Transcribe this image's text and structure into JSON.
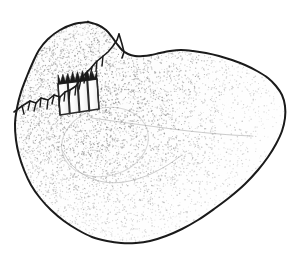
{
  "figure": {
    "domain": "scientific-line-drawing",
    "background_color": "#ffffff",
    "ink_color": "#1a1a1a",
    "stipple_color": "#8c8c8c",
    "stipple_color_dense": "#6e6e6e",
    "hatch_fill_color": "#fbfbfb",
    "hatch_line_color": "#2b2b2b",
    "width_px": 297,
    "height_px": 260,
    "labels": [],
    "scale_bar": null,
    "caption": ""
  },
  "outline": {
    "name": "specimen-outline-path",
    "stroke_width": 2,
    "description": "Rounded triangular outline, apex at right, broad lobe upper-left, rounded base lower-left to lower-centre",
    "points": [
      [
        88,
        22
      ],
      [
        74,
        24
      ],
      [
        60,
        30
      ],
      [
        48,
        39
      ],
      [
        39,
        50
      ],
      [
        33,
        62
      ],
      [
        27,
        76
      ],
      [
        21,
        92
      ],
      [
        17,
        108
      ],
      [
        15,
        124
      ],
      [
        16,
        140
      ],
      [
        19,
        155
      ],
      [
        24,
        170
      ],
      [
        31,
        185
      ],
      [
        40,
        198
      ],
      [
        51,
        210
      ],
      [
        64,
        221
      ],
      [
        78,
        230
      ],
      [
        92,
        237
      ],
      [
        107,
        241
      ],
      [
        121,
        243
      ],
      [
        136,
        243
      ],
      [
        150,
        241
      ],
      [
        166,
        236
      ],
      [
        182,
        229
      ],
      [
        198,
        220
      ],
      [
        214,
        209
      ],
      [
        230,
        197
      ],
      [
        245,
        184
      ],
      [
        258,
        170
      ],
      [
        268,
        157
      ],
      [
        276,
        144
      ],
      [
        282,
        131
      ],
      [
        285,
        118
      ],
      [
        285,
        106
      ],
      [
        282,
        95
      ],
      [
        276,
        86
      ],
      [
        268,
        78
      ],
      [
        257,
        71
      ],
      [
        245,
        65
      ],
      [
        232,
        60
      ],
      [
        219,
        56
      ],
      [
        206,
        53
      ],
      [
        193,
        51
      ],
      [
        181,
        50
      ],
      [
        170,
        51
      ],
      [
        160,
        53
      ],
      [
        151,
        55
      ],
      [
        143,
        56
      ],
      [
        135,
        56
      ],
      [
        128,
        54
      ],
      [
        122,
        50
      ],
      [
        117,
        44
      ],
      [
        112,
        37
      ],
      [
        106,
        30
      ],
      [
        98,
        25
      ],
      [
        88,
        22
      ]
    ]
  },
  "features": [
    {
      "name": "suture-crack-line",
      "type": "jagged-break-line",
      "stroke_width": 1.6,
      "description": "Irregular zig-zag fracture / suture line running from the left margin up-right to the upper notch, with short barb ticks",
      "points": [
        [
          14,
          112
        ],
        [
          22,
          106
        ],
        [
          30,
          101
        ],
        [
          36,
          103
        ],
        [
          41,
          98
        ],
        [
          48,
          100
        ],
        [
          54,
          95
        ],
        [
          60,
          97
        ],
        [
          65,
          92
        ],
        [
          70,
          90
        ],
        [
          76,
          86
        ],
        [
          80,
          80
        ],
        [
          85,
          74
        ],
        [
          91,
          68
        ],
        [
          96,
          62
        ],
        [
          102,
          57
        ],
        [
          108,
          52
        ],
        [
          113,
          46
        ],
        [
          117,
          40
        ],
        [
          119,
          34
        ]
      ],
      "barbs": [
        [
          [
            30,
            101
          ],
          [
            28,
            110
          ]
        ],
        [
          [
            36,
            103
          ],
          [
            34,
            111
          ]
        ],
        [
          [
            41,
            98
          ],
          [
            40,
            107
          ]
        ],
        [
          [
            48,
            100
          ],
          [
            47,
            109
          ]
        ],
        [
          [
            54,
            95
          ],
          [
            52,
            104
          ]
        ],
        [
          [
            60,
            97
          ],
          [
            59,
            106
          ]
        ],
        [
          [
            65,
            92
          ],
          [
            64,
            101
          ]
        ],
        [
          [
            70,
            90
          ],
          [
            69,
            99
          ]
        ],
        [
          [
            76,
            86
          ],
          [
            75,
            95
          ]
        ],
        [
          [
            81,
            79
          ],
          [
            79,
            89
          ]
        ],
        [
          [
            86,
            73
          ],
          [
            84,
            83
          ]
        ],
        [
          [
            92,
            67
          ],
          [
            90,
            77
          ]
        ],
        [
          [
            97,
            61
          ],
          [
            96,
            71
          ]
        ],
        [
          [
            103,
            56
          ],
          [
            102,
            66
          ]
        ],
        [
          [
            22,
            106
          ],
          [
            24,
            114
          ]
        ]
      ]
    },
    {
      "name": "notch-upper-right",
      "type": "edge-notch",
      "stroke_width": 1.6,
      "description": "Short vertical notch where the upper lobe meets the right ridge",
      "points": [
        [
          119,
          34
        ],
        [
          122,
          44
        ],
        [
          124,
          52
        ],
        [
          122,
          58
        ]
      ]
    },
    {
      "name": "hatched-block",
      "type": "striped-rectangular-feature",
      "description": "Tilted rectangular block with four pale vertical bars divided by dark ruled lines; represents a cut / sectioned area",
      "corners": [
        [
          58,
          84
        ],
        [
          97,
          79
        ],
        [
          99,
          109
        ],
        [
          60,
          115
        ]
      ],
      "bar_count": 4,
      "rotation_deg": -6
    },
    {
      "name": "internal-contour-oval",
      "type": "faint-internal-contour",
      "stroke_width": 1,
      "description": "Soft pale oval depression below the hatched block",
      "center": [
        105,
        142
      ],
      "rx": 44,
      "ry": 34,
      "rotation_deg": -15
    },
    {
      "name": "internal-ridge-line",
      "type": "faint-internal-contour",
      "stroke_width": 1,
      "description": "Faint sweeping ridge across the centre of the specimen toward the right apex",
      "points": [
        [
          92,
          118
        ],
        [
          120,
          122
        ],
        [
          150,
          126
        ],
        [
          180,
          130
        ],
        [
          208,
          133
        ],
        [
          232,
          135
        ],
        [
          252,
          136
        ]
      ]
    },
    {
      "name": "internal-shadow-sweep",
      "type": "faint-internal-contour",
      "stroke_width": 1,
      "description": "Faint lower boundary of the central depression sweeping to the lower left",
      "points": [
        [
          62,
          150
        ],
        [
          72,
          165
        ],
        [
          86,
          176
        ],
        [
          104,
          182
        ],
        [
          124,
          182
        ],
        [
          146,
          176
        ],
        [
          166,
          166
        ],
        [
          182,
          155
        ]
      ]
    }
  ],
  "stipple": {
    "name": "stipple-shading",
    "description": "Fine random dot stipple filling the specimen body; denser along the upper-left margin and around the central depression, sparser toward the lower-right",
    "dot_count": 5200,
    "dot_radius_px": 0.55,
    "density_gradient": "upper-left-dense-to-lower-right-sparse"
  }
}
